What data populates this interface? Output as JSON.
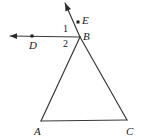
{
  "figure": {
    "background_color": "#ffffff",
    "stroke_color": "#3a3a3a",
    "label_color": "#1a1a1a",
    "points": {
      "A": {
        "label": "A",
        "x": 41,
        "y": 121,
        "label_x": 34,
        "label_y": 126
      },
      "B": {
        "label": "B",
        "x": 80,
        "y": 37,
        "label_x": 83,
        "label_y": 31
      },
      "C": {
        "label": "C",
        "x": 127,
        "y": 120,
        "label_x": 126,
        "label_y": 126
      },
      "D": {
        "label": "D",
        "x": 32,
        "y": 36,
        "label_x": 29,
        "label_y": 40
      },
      "E": {
        "label": "E",
        "x": 78,
        "y": 22,
        "label_x": 82,
        "label_y": 15
      }
    },
    "angles": {
      "one": {
        "label": "1",
        "x": 63,
        "y": 24
      },
      "two": {
        "label": "2",
        "x": 63,
        "y": 39
      }
    },
    "segments": [
      {
        "name": "side-AB",
        "from": "A",
        "to": "B"
      },
      {
        "name": "side-BC",
        "from": "B",
        "to": "C"
      },
      {
        "name": "side-AC",
        "from": "A",
        "to": "C"
      }
    ],
    "rays": [
      {
        "name": "ray-BD",
        "from": "B",
        "through": "D",
        "arrow_x": 10,
        "arrow_y": 36
      },
      {
        "name": "ray-BE",
        "from": "B",
        "through": "E",
        "arrow_x": 65,
        "arrow_y": 3
      }
    ]
  }
}
